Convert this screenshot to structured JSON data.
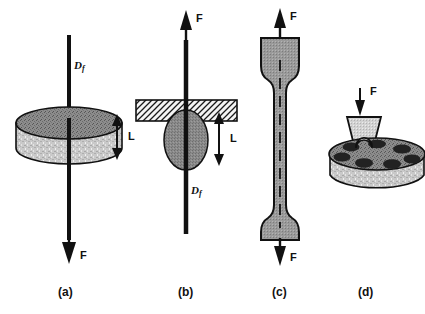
{
  "figure": {
    "caption_type": "four-panel mechanical test schematic",
    "background_color": "#ffffff",
    "ink_color": "#111111"
  },
  "palette": {
    "fiber_black": "#111111",
    "disk_top_gray": "#8c8c8c",
    "disk_body_gray": "#c9c9c9",
    "droplet_gray": "#8a8a8a",
    "specimen_gray": "#9a9a9a",
    "hatch_gray": "#f2f2f2",
    "hole_dark": "#222222",
    "ball_white": "#fdfdfd",
    "indenter_gray": "#d2d2d2",
    "outline": "#111111"
  },
  "panels": [
    {
      "id": "a",
      "label": "(a)",
      "name": "fiber-pullout-disk",
      "force_labels": [
        {
          "text": "F",
          "direction": "down",
          "position": "bottom"
        }
      ],
      "symbol_labels": [
        {
          "base": "D",
          "sub": "f",
          "name": "fiber-diameter-label"
        }
      ],
      "dimension_labels": [
        {
          "text": "L",
          "name": "embedded-length-label"
        }
      ]
    },
    {
      "id": "b",
      "label": "(b)",
      "name": "fiber-pullout-plate",
      "force_labels": [
        {
          "text": "F",
          "direction": "up",
          "position": "top"
        }
      ],
      "symbol_labels": [
        {
          "base": "D",
          "sub": "f",
          "name": "fiber-diameter-label"
        }
      ],
      "dimension_labels": [
        {
          "text": "L",
          "name": "embedded-length-label"
        }
      ]
    },
    {
      "id": "c",
      "label": "(c)",
      "name": "dogbone-tensile-specimen",
      "force_labels": [
        {
          "text": "F",
          "direction": "up",
          "position": "top"
        },
        {
          "text": "F",
          "direction": "down",
          "position": "bottom"
        }
      ],
      "symbol_labels": [],
      "dimension_labels": []
    },
    {
      "id": "d",
      "label": "(d)",
      "name": "ball-indentation-test",
      "force_labels": [
        {
          "text": "F",
          "direction": "down",
          "position": "top"
        }
      ],
      "symbol_labels": [],
      "dimension_labels": []
    }
  ]
}
